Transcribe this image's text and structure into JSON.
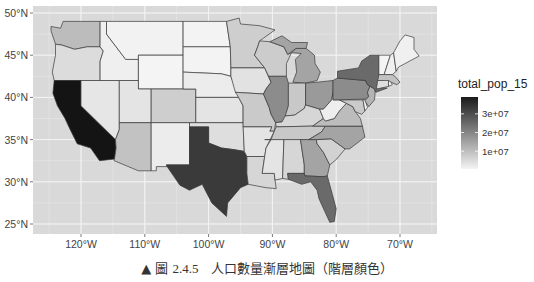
{
  "chart_data": {
    "type": "choropleth",
    "title": "",
    "fill_variable": "total_pop_15",
    "legend": {
      "title": "total_pop_15",
      "position": "right",
      "breaks": [
        10000000,
        20000000,
        30000000
      ],
      "labels": [
        "1e+07",
        "2e+07",
        "3e+07"
      ],
      "low_color": "#f4f4f4",
      "high_color": "#1a1a1a"
    },
    "x_axis": {
      "ticks": [
        -120,
        -110,
        -100,
        -90,
        -80,
        -70
      ],
      "labels": [
        "120°W",
        "110°W",
        "100°W",
        "90°W",
        "80°W",
        "70°W"
      ],
      "range": [
        -125,
        -66.5
      ]
    },
    "y_axis": {
      "ticks": [
        25,
        30,
        35,
        40,
        45,
        50
      ],
      "labels": [
        "25°N",
        "30°N",
        "35°N",
        "40°N",
        "45°N",
        "50°N"
      ],
      "range": [
        24,
        50.5
      ]
    },
    "grid": true,
    "panel_background": "#d9d9d9",
    "grid_color": "#f2f2f2",
    "states_shading": {
      "California": "#141414",
      "Texas": "#3a3a3a",
      "Florida": "#6a6a6a",
      "New York": "#6a6a6a",
      "Illinois": "#8c8c8c",
      "Pennsylvania": "#8c8c8c",
      "Ohio": "#9a9a9a",
      "Georgia": "#a4a4a4",
      "North Carolina": "#a4a4a4",
      "Michigan": "#a4a4a4",
      "New Jersey": "#b4b4b4",
      "Virginia": "#bcbcbc",
      "Washington": "#bcbcbc",
      "Arizona": "#c2c2c2",
      "Massachusetts": "#c2c2c2",
      "Indiana": "#c8c8c8",
      "Tennessee": "#c8c8c8",
      "Missouri": "#cacaca",
      "Maryland": "#cacaca",
      "Wisconsin": "#cccccc",
      "Minnesota": "#cecece",
      "Colorado": "#cecece",
      "South Carolina": "#d2d2d2",
      "Alabama": "#d6d6d6",
      "Louisiana": "#d6d6d6",
      "Kentucky": "#d6d6d6",
      "Oregon": "#dcdcdc",
      "Oklahoma": "#dedede",
      "Connecticut": "#dedede",
      "Iowa": "#e2e2e2",
      "Mississippi": "#e4e4e4",
      "Arkansas": "#e4e4e4",
      "Utah": "#e4e4e4",
      "Kansas": "#e4e4e4",
      "Nevada": "#e6e6e6",
      "New Mexico": "#ececec",
      "Nebraska": "#ececec",
      "West Virginia": "#eeeeee",
      "Idaho": "#efefef",
      "Maine": "#f0f0f0",
      "New Hampshire": "#f0f0f0",
      "Rhode Island": "#f0f0f0",
      "Montana": "#f2f2f2",
      "Delaware": "#f2f2f2",
      "South Dakota": "#f3f3f3",
      "North Dakota": "#f3f3f3",
      "Vermont": "#f4f4f4",
      "Wyoming": "#f4f4f4"
    }
  },
  "caption": {
    "marker": "▲",
    "prefix": "圖",
    "number": "2.4.5",
    "text": "人口數量漸層地圖（階層顏色）"
  }
}
